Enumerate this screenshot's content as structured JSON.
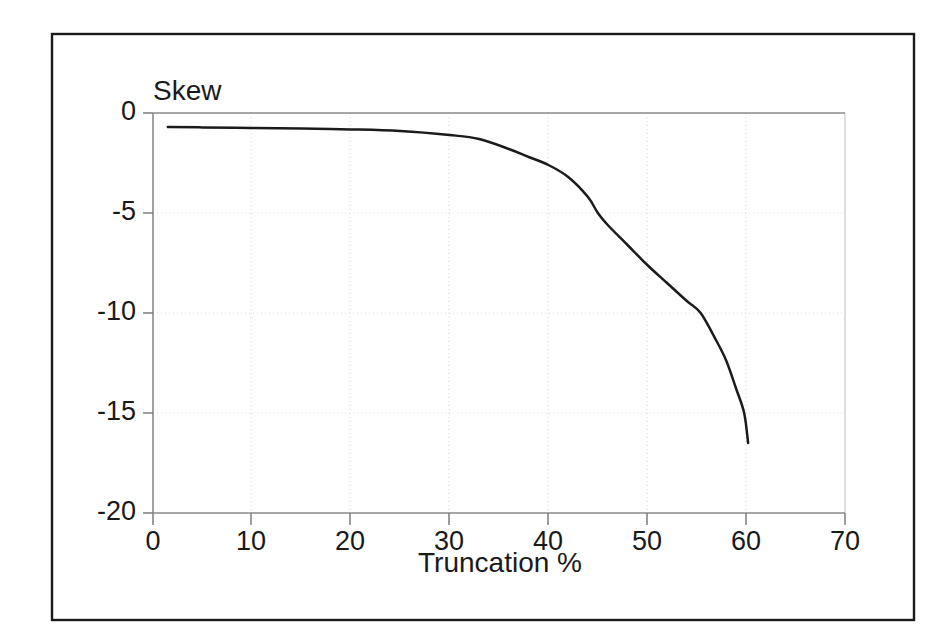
{
  "figure": {
    "background_color": "#ffffff",
    "frame_color": "#1a1a1a",
    "curve_color": "#1b1b1b",
    "grid_color": "#d8d8d8",
    "axis_color": "#8a8a8a"
  },
  "chart_data": {
    "type": "line",
    "title": "",
    "ylabel": "Skew",
    "xlabel": "Truncation %",
    "xlim": [
      0,
      70
    ],
    "ylim": [
      -20,
      0
    ],
    "xticks": [
      0,
      10,
      20,
      30,
      40,
      50,
      60,
      70
    ],
    "xtick_labels": [
      "0",
      "10",
      "20",
      "30",
      "40",
      "50",
      "60",
      "70"
    ],
    "yticks": [
      0,
      -5,
      -10,
      -15,
      -20
    ],
    "ytick_labels": [
      "0",
      "-5",
      "-10",
      "-15",
      "-20"
    ],
    "grid": true,
    "legend": false,
    "legend_position": "none",
    "series": [
      {
        "name": "Skew vs Truncation",
        "x": [
          1.5,
          5,
          10,
          15,
          20,
          25,
          30,
          33,
          36,
          38,
          40,
          42,
          44,
          45,
          46,
          48,
          50,
          52,
          54,
          55.4,
          57,
          58,
          59,
          59.8,
          60.2
        ],
        "y": [
          -0.7,
          -0.72,
          -0.75,
          -0.78,
          -0.82,
          -0.9,
          -1.1,
          -1.3,
          -1.8,
          -2.2,
          -2.6,
          -3.2,
          -4.2,
          -5.0,
          -5.6,
          -6.6,
          -7.6,
          -8.5,
          -9.4,
          -10.0,
          -11.4,
          -12.4,
          -13.8,
          -15.0,
          -16.5
        ]
      }
    ],
    "annotations": []
  }
}
